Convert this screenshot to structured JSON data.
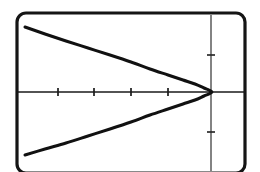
{
  "figure": {
    "name": "parabola-graph",
    "background_color": "#ffffff",
    "frame": {
      "name": "calculator-screen-frame",
      "x": 17,
      "y": 13,
      "width": 228,
      "height": 160,
      "corner_radius": 9,
      "stroke_color": "#151515",
      "stroke_width": 3.2
    },
    "axes": {
      "x_axis": {
        "label": "x-axis",
        "y_pixel": 92,
        "x_start": 18,
        "x_end": 245,
        "stroke_color": "#1a1a1a",
        "stroke_width": 1.6,
        "ticks": [
          58,
          94,
          131,
          168
        ],
        "tick_half_length": 4,
        "tick_stroke_width": 1.7
      },
      "y_axis": {
        "label": "y-axis",
        "x_pixel": 211,
        "y_start": 15,
        "y_end": 171,
        "stroke_color": "#5a5a5a",
        "stroke_width": 1.5,
        "ticks": [
          55,
          132
        ],
        "tick_half_length": 4,
        "tick_stroke_width": 1.7
      }
    },
    "curve": {
      "label": "leftward-opening-parabola",
      "stroke_color": "#111111",
      "stroke_width": 3.0,
      "vertex_px": [
        212,
        92
      ],
      "upper_endpoint_px": [
        25,
        27
      ],
      "lower_endpoint_px": [
        25,
        155
      ]
    }
  },
  "chart_data": {
    "type": "line",
    "title": "",
    "subtitle": "",
    "xlabel": "",
    "ylabel": "",
    "grid": false,
    "legend": null,
    "annotations": [],
    "equation": "x = -a*y^2 + h",
    "orientation": "opens-left",
    "vertex": [
      212,
      92
    ],
    "axis_ranges": {
      "x_pixel_range": [
        18,
        245
      ],
      "y_pixel_range": [
        15,
        171
      ]
    },
    "xtick_pixels": [
      58,
      94,
      131,
      168
    ],
    "ytick_pixels": [
      55,
      132
    ],
    "xtick_labels": [
      "",
      "",
      "",
      ""
    ],
    "ytick_labels": [
      "",
      ""
    ],
    "series": [
      {
        "name": "parabola-upper-branch",
        "points_px": [
          [
            25,
            27
          ],
          [
            45,
            34
          ],
          [
            66,
            41
          ],
          [
            88,
            48
          ],
          [
            110,
            55
          ],
          [
            131,
            62
          ],
          [
            150,
            69
          ],
          [
            168,
            75
          ],
          [
            183,
            80
          ],
          [
            195,
            84
          ],
          [
            204,
            88
          ],
          [
            209,
            90
          ],
          [
            212,
            92
          ]
        ]
      },
      {
        "name": "parabola-lower-branch",
        "points_px": [
          [
            212,
            92
          ],
          [
            209,
            94
          ],
          [
            204,
            96
          ],
          [
            195,
            100
          ],
          [
            183,
            104
          ],
          [
            168,
            109
          ],
          [
            150,
            115
          ],
          [
            131,
            122
          ],
          [
            110,
            129
          ],
          [
            88,
            136
          ],
          [
            66,
            143
          ],
          [
            45,
            149
          ],
          [
            25,
            155
          ]
        ]
      }
    ]
  }
}
